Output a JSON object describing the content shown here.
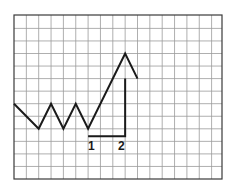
{
  "chart_data": {
    "type": "line",
    "title": "",
    "xlabel": "",
    "ylabel": "",
    "grid": true,
    "legend": null,
    "grid_cols": 17,
    "grid_rows": 13,
    "series": [
      {
        "name": "price",
        "points": [
          [
            0,
            6
          ],
          [
            2,
            4
          ],
          [
            3,
            6
          ],
          [
            4,
            4
          ],
          [
            5,
            6
          ],
          [
            6,
            4
          ],
          [
            9,
            10
          ],
          [
            10,
            8
          ]
        ]
      }
    ],
    "annotations": {
      "bracket": {
        "vertical": {
          "x": 9,
          "y_from": 8,
          "y_to": 3.4
        },
        "horizontal": {
          "y": 3.4,
          "x_from": 6,
          "x_to": 9
        }
      },
      "labels": [
        {
          "text": "1",
          "x": 6
        },
        {
          "text": "2",
          "x": 9
        }
      ]
    }
  },
  "colors": {
    "line": "#1a1a1a",
    "grid": "#9a9a9a",
    "frame": "#3a3a3a",
    "background": "#ffffff"
  },
  "labels": {
    "one": "1",
    "two": "2"
  }
}
